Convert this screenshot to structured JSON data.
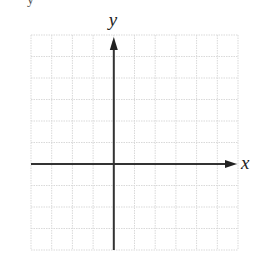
{
  "diagram": {
    "type": "coordinate-grid",
    "title_fragment": "y",
    "grid": {
      "columns": 10,
      "rows": 10,
      "origin_column": 4,
      "origin_row": 6,
      "left": 31,
      "top": 35,
      "right": 238,
      "bottom": 250,
      "line_color": "#d9d9d9",
      "line_style": "dotted"
    },
    "axes": {
      "color": "#333333",
      "x_label": "x",
      "y_label": "y",
      "x_arrow": "right",
      "y_arrow": "up"
    }
  }
}
